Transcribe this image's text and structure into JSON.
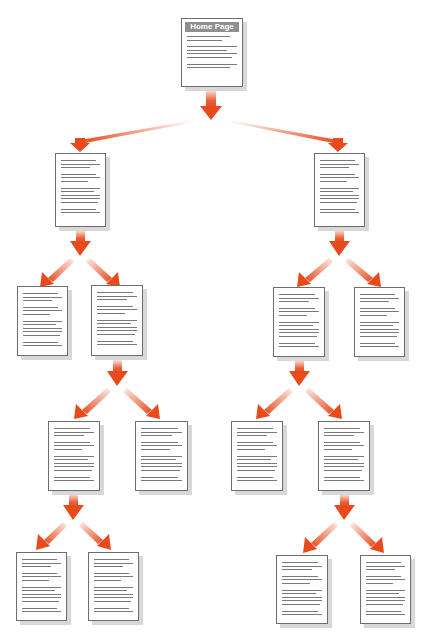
{
  "diagram": {
    "type": "site-hierarchy-tree",
    "arrow_color": "#e84a1c",
    "page_border_color": "#6d6d6d",
    "header_color": "#8f8f8f",
    "root": {
      "id": "home",
      "label": "Home Page"
    },
    "nodes": [
      {
        "id": "home",
        "parent": null,
        "label": "Home Page",
        "x": 181,
        "y": 18,
        "w": 62,
        "h": 69
      },
      {
        "id": "l1a",
        "parent": "home",
        "x": 55,
        "y": 153,
        "w": 51,
        "h": 74
      },
      {
        "id": "l1b",
        "parent": "home",
        "x": 314,
        "y": 153,
        "w": 51,
        "h": 74
      },
      {
        "id": "l2a",
        "parent": "l1a",
        "x": 17,
        "y": 286,
        "w": 51,
        "h": 70
      },
      {
        "id": "l2b",
        "parent": "l1a",
        "x": 91,
        "y": 285,
        "w": 52,
        "h": 71
      },
      {
        "id": "l2c",
        "parent": "l1b",
        "x": 273,
        "y": 287,
        "w": 52,
        "h": 70
      },
      {
        "id": "l2d",
        "parent": "l1b",
        "x": 354,
        "y": 287,
        "w": 51,
        "h": 70
      },
      {
        "id": "l3a",
        "parent": "l2b",
        "x": 48,
        "y": 421,
        "w": 52,
        "h": 70
      },
      {
        "id": "l3b",
        "parent": "l2b",
        "x": 135,
        "y": 421,
        "w": 53,
        "h": 70
      },
      {
        "id": "l3c",
        "parent": "l2c",
        "x": 231,
        "y": 421,
        "w": 52,
        "h": 70
      },
      {
        "id": "l3d",
        "parent": "l2c",
        "x": 318,
        "y": 421,
        "w": 52,
        "h": 70
      },
      {
        "id": "l4a",
        "parent": "l3a",
        "x": 16,
        "y": 552,
        "w": 51,
        "h": 69
      },
      {
        "id": "l4b",
        "parent": "l3a",
        "x": 88,
        "y": 552,
        "w": 51,
        "h": 69
      },
      {
        "id": "l4c",
        "parent": "l3d",
        "x": 276,
        "y": 555,
        "w": 52,
        "h": 69
      },
      {
        "id": "l4d",
        "parent": "l3d",
        "x": 360,
        "y": 555,
        "w": 51,
        "h": 69
      }
    ]
  }
}
